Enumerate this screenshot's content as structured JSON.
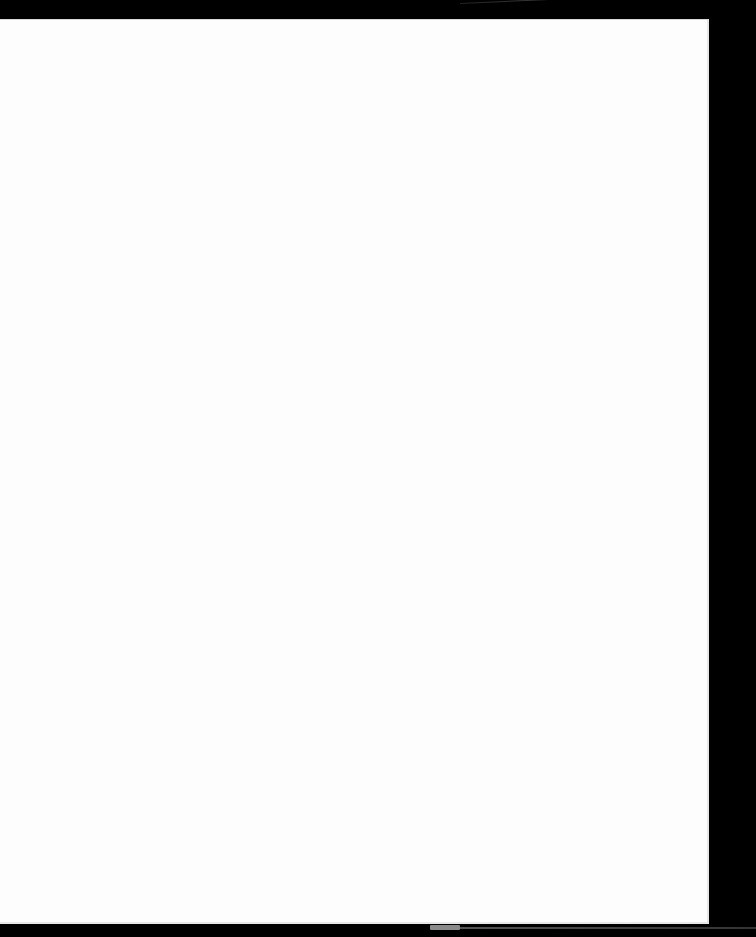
{
  "scene": {
    "description": "Blank white sheet of paper on black background",
    "background_color": "#000000",
    "paper_color": "#fdfdfd",
    "text_content": []
  }
}
